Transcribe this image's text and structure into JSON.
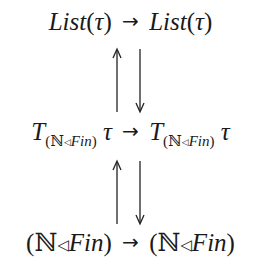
{
  "diagram": {
    "rows": [
      {
        "left": {
          "name": "List",
          "arg": "τ"
        },
        "arrow": "→",
        "right": {
          "name": "List",
          "arg": "τ"
        }
      },
      {
        "left": {
          "name": "T",
          "sub": [
            "(",
            "ℕ",
            "◁",
            "Fin",
            ")"
          ],
          "arg": "τ"
        },
        "arrow": "→",
        "right": {
          "name": "T",
          "sub": [
            "(",
            "ℕ",
            "◁",
            "Fin",
            ")"
          ],
          "arg": "τ"
        }
      },
      {
        "left": {
          "open": "(",
          "nat": "ℕ",
          "tri": "◁",
          "fin": "Fin",
          "close": ")"
        },
        "arrow": "→",
        "right": {
          "open": "(",
          "nat": "ℕ",
          "tri": "◁",
          "fin": "Fin",
          "close": ")"
        }
      }
    ],
    "vertical_arrows": [
      {
        "between": "row0-row1",
        "up": "↑",
        "down": "↓"
      },
      {
        "between": "row1-row2",
        "up": "↑",
        "down": "↓"
      }
    ],
    "paren_open": "(",
    "paren_close": ")"
  }
}
